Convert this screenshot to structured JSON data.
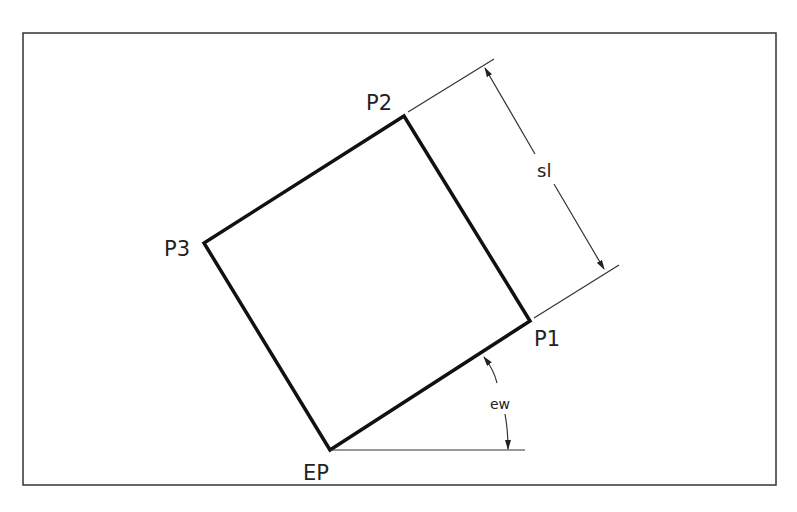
{
  "diagram": {
    "labels": {
      "p1": "P1",
      "p2": "P2",
      "p3": "P3",
      "ep": "EP",
      "side_length": "sl",
      "angle": "ew"
    },
    "colors": {
      "line": "#111111",
      "thin_line": "#333333",
      "background": "#ffffff"
    }
  }
}
